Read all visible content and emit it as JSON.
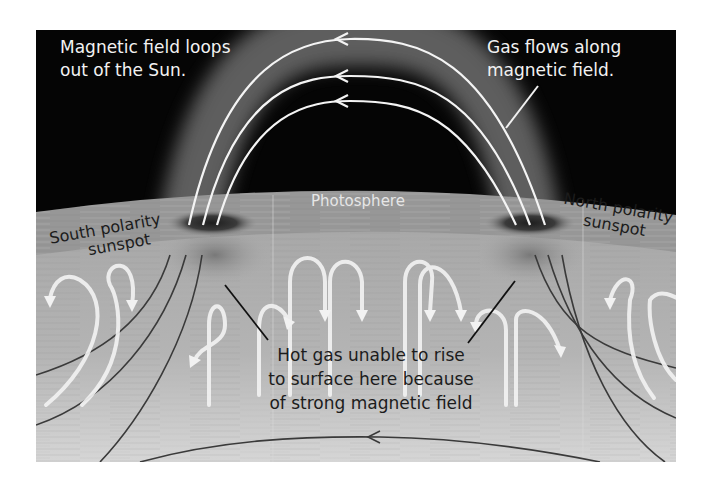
{
  "diagram": {
    "colors": {
      "space": "#050505",
      "photosphere": "#9a9a9a",
      "interior_top": "#a8a8a8",
      "interior_bottom": "#d4d4d4",
      "field_lines_above": "#f4f4f4",
      "field_lines_below": "#3a3a3a",
      "convection_arrows": "#f2f2f2",
      "loop_glow": "#7a7a7a",
      "sunspot": "#2a2a2a"
    },
    "labels": {
      "top_left": [
        "Magnetic field loops",
        "out of the Sun."
      ],
      "top_right": [
        "Gas flows along",
        "magnetic field."
      ],
      "photosphere": "Photosphere",
      "south_sunspot": [
        "South polarity",
        "sunspot"
      ],
      "north_sunspot": [
        "North polarity",
        "sunspot"
      ],
      "center": [
        "Hot gas unable to rise",
        "to surface here because",
        "of strong magnetic field"
      ]
    },
    "elements": {
      "magnetic_loops": 3,
      "loop_arrow_direction": "left",
      "subsurface_field_lines_left": 3,
      "subsurface_field_lines_right": 3,
      "convection_cells": 9,
      "deep_field_line_arrow_direction": "left"
    }
  }
}
